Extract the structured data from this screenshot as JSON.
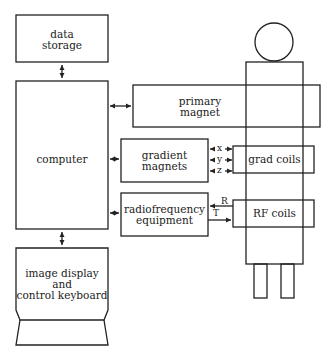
{
  "diagram": {
    "type": "block diagram",
    "blocks": {
      "data_storage": "data\nstorage",
      "computer": "computer",
      "primary_magnet": "primary\nmagnet",
      "gradient_magnets": "gradient\nmagnets",
      "grad_coils": "grad coils",
      "radiofrequency_equipment": "radiofrequency\nequipment",
      "rf_coils": "RF coils",
      "image_display": "image display\nand\ncontrol keyboard"
    },
    "axis_labels": [
      "x",
      "y",
      "z"
    ],
    "rf_signal_labels": {
      "receive": "R",
      "transmit": "T"
    },
    "connections": [
      {
        "from": "data storage",
        "to": "computer",
        "type": "bidirectional"
      },
      {
        "from": "computer",
        "to": "primary magnet",
        "type": "bidirectional"
      },
      {
        "from": "computer",
        "to": "gradient magnets",
        "type": "bidirectional"
      },
      {
        "from": "computer",
        "to": "radiofrequency equipment",
        "type": "bidirectional"
      },
      {
        "from": "computer",
        "to": "image display and control keyboard",
        "type": "bidirectional"
      },
      {
        "from": "gradient magnets",
        "to": "grad coils",
        "labels": [
          "x",
          "y",
          "z"
        ],
        "type": "bidirectional"
      },
      {
        "from": "RF coils",
        "to": "radiofrequency equipment",
        "label": "R",
        "type": "directed"
      },
      {
        "from": "radiofrequency equipment",
        "to": "RF coils",
        "label": "T",
        "type": "directed"
      }
    ],
    "colors": {
      "stroke": "#222222",
      "background": "#ffffff"
    }
  }
}
